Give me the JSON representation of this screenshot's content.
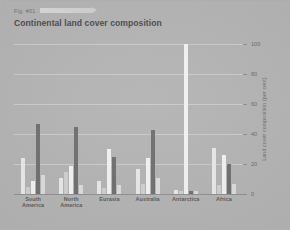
{
  "header": {
    "figure_label": "Fig. #01",
    "title": "Continental land cover composition"
  },
  "axis": {
    "y_title": "Land cover composition (per cent)",
    "y_ticks": [
      "0",
      "20",
      "40",
      "60",
      "80",
      "100"
    ]
  },
  "colors": {
    "background": "#b3b3b3",
    "series_light": "#e8e8e8",
    "series_mid": "#cfcfcf",
    "series_dark": "#6e6e6e",
    "series_white": "#f5f5f5",
    "gridline": "#c8c8c8",
    "text": "#5a5a5a"
  },
  "chart_data": {
    "type": "bar",
    "title": "Continental land cover composition",
    "xlabel": "",
    "ylabel": "Land cover composition (per cent)",
    "ylim": [
      0,
      100
    ],
    "yticks": [
      0,
      20,
      40,
      60,
      80,
      100
    ],
    "grid": true,
    "legend": "none",
    "categories": [
      "South America",
      "North America",
      "Eurasia",
      "Australia",
      "Antarctica",
      "Africa"
    ],
    "series": [
      {
        "name": "Series 1",
        "color": "#e8e8e8",
        "values": [
          24,
          11,
          9,
          17,
          3,
          31
        ]
      },
      {
        "name": "Series 2",
        "color": "#cfcfcf",
        "values": [
          5,
          15,
          4,
          7,
          2,
          6
        ]
      },
      {
        "name": "Series 3",
        "color": "#f2f2f2",
        "values": [
          9,
          19,
          30,
          24,
          100,
          26
        ]
      },
      {
        "name": "Series 4",
        "color": "#6e6e6e",
        "values": [
          47,
          45,
          25,
          43,
          2,
          20
        ]
      },
      {
        "name": "Series 5",
        "color": "#dcdcdc",
        "values": [
          13,
          6,
          6,
          11,
          2,
          7
        ]
      }
    ]
  }
}
